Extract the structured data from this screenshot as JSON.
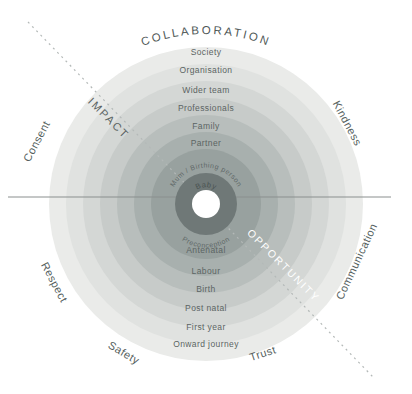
{
  "outer_labels": {
    "top": "COLLABORATION",
    "top_left": "Consent",
    "top_right": "Kindness",
    "left": "Respect",
    "right": "Communication",
    "bottom_left": "Safety",
    "bottom_right": "Trust"
  },
  "axis_labels": {
    "impact": "IMPACT",
    "opportunity": "OPPORTUNITY"
  },
  "rings": {
    "top_labels": [
      "Society",
      "Organisation",
      "Wider team",
      "Professionals",
      "Family",
      "Partner"
    ],
    "bottom_labels": [
      "Antenatal",
      "Labour",
      "Birth",
      "Post natal",
      "First year",
      "Onward journey"
    ],
    "inner_top": "Mum / Birthing person",
    "inner_bottom": "Preconception",
    "center": "Baby"
  },
  "colors": {
    "rings": [
      "#eaebe9",
      "#e0e2e0",
      "#d4d7d5",
      "#c7cbc9",
      "#b8bebc",
      "#a8b0ae",
      "#98a19f"
    ],
    "center_disc": "#6f7877",
    "center_hole": "#ffffff",
    "horizontal_line": "#8a8f8e",
    "dashed_line": "#b4b9b8",
    "opportunity_text": "#ffffff",
    "heading_text": "#4f5857"
  }
}
